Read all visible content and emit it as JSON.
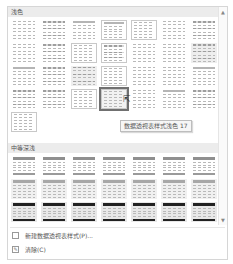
{
  "gallery": {
    "sections": [
      {
        "title": "浅色",
        "rows": 6,
        "columns": 7,
        "count": 29
      },
      {
        "title": "中等深浅",
        "rows": 3,
        "columns": 7,
        "count": 21
      }
    ],
    "selected_index": 24,
    "tooltip": "数据透视表样式浅色 17"
  },
  "scrollbar": {
    "up": "▲",
    "down": "▼"
  },
  "menu": {
    "items": [
      {
        "label": "新建数据透视表样式(P)...",
        "icon": "new-style-icon"
      },
      {
        "label": "清除(C)",
        "icon": "clear-icon"
      }
    ]
  },
  "cursor": "⇱"
}
